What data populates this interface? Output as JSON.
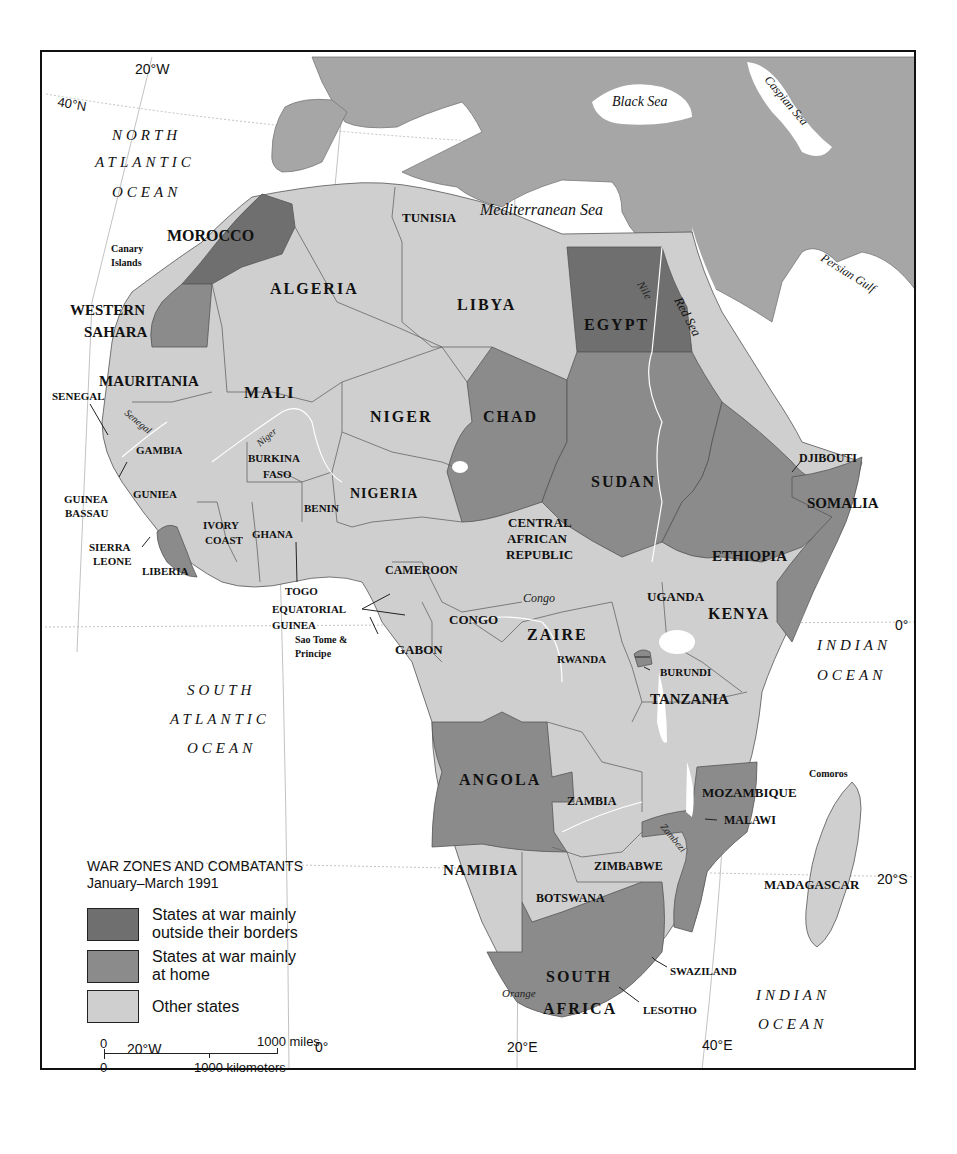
{
  "colors": {
    "war_outside": "#6f6f6f",
    "war_home": "#8b8b8b",
    "other": "#cfcfcf",
    "non_africa_land": "#a6a6a6",
    "water": "#ffffff",
    "border": "#555555"
  },
  "legend": {
    "title": "WAR ZONES AND COMBATANTS",
    "subtitle": "January–March 1991",
    "items": [
      {
        "label_line1": "States at war mainly",
        "label_line2": "outside their borders",
        "category": "war_outside"
      },
      {
        "label_line1": "States at war mainly",
        "label_line2": "at home",
        "category": "war_home"
      },
      {
        "label_line1": "Other states",
        "label_line2": "",
        "category": "other"
      }
    ]
  },
  "scale": {
    "miles_zero": "0",
    "miles_label": "1000 miles",
    "km_zero": "0",
    "km_label": "1000 kilometers"
  },
  "coordinates": {
    "top_20w": "20°W",
    "lat_40n": "40°N",
    "equator": "0°",
    "lat_20s": "20°S",
    "bottom_20w": "20°W",
    "bottom_0": "0°",
    "bottom_20e": "20°E",
    "bottom_40e": "40°E"
  },
  "water_labels": {
    "north_atlantic": [
      "NORTH",
      "ATLANTIC",
      "OCEAN"
    ],
    "south_atlantic": [
      "SOUTH",
      "ATLANTIC",
      "OCEAN"
    ],
    "indian_east": [
      "INDIAN",
      "OCEAN"
    ],
    "indian_south": [
      "INDIAN",
      "OCEAN"
    ],
    "black_sea": "Black Sea",
    "caspian_sea": "Caspian Sea",
    "mediterranean": "Mediterranean Sea",
    "persian_gulf": "Persian Gulf",
    "red_sea": "Red Sea"
  },
  "rivers": {
    "nile": "Nile",
    "senegal": "Senegal",
    "niger": "Niger",
    "congo": "Congo",
    "zambezi": "Zambezi",
    "orange": "Orange"
  },
  "countries": [
    {
      "name": "MOROCCO",
      "category": "war_outside"
    },
    {
      "name": "WESTERN SAHARA",
      "category": "war_home"
    },
    {
      "name": "ALGERIA",
      "category": "other"
    },
    {
      "name": "TUNISIA",
      "category": "other"
    },
    {
      "name": "LIBYA",
      "category": "other"
    },
    {
      "name": "EGYPT",
      "category": "war_outside"
    },
    {
      "name": "MAURITANIA",
      "category": "other"
    },
    {
      "name": "MALI",
      "category": "other"
    },
    {
      "name": "NIGER",
      "category": "other"
    },
    {
      "name": "CHAD",
      "category": "war_home"
    },
    {
      "name": "SUDAN",
      "category": "war_home"
    },
    {
      "name": "SENEGAL",
      "category": "other"
    },
    {
      "name": "GAMBIA",
      "category": "other"
    },
    {
      "name": "GUINEA BASSAU",
      "category": "other"
    },
    {
      "name": "GUNIEA",
      "category": "other"
    },
    {
      "name": "SIERRA LEONE",
      "category": "other"
    },
    {
      "name": "LIBERIA",
      "category": "war_home"
    },
    {
      "name": "IVORY COAST",
      "category": "other"
    },
    {
      "name": "BURKINA FASO",
      "category": "other"
    },
    {
      "name": "GHANA",
      "category": "other"
    },
    {
      "name": "TOGO",
      "category": "other"
    },
    {
      "name": "BENIN",
      "category": "other"
    },
    {
      "name": "NIGERIA",
      "category": "other"
    },
    {
      "name": "CAMEROON",
      "category": "other"
    },
    {
      "name": "EQUATORIAL GUINEA",
      "category": "other"
    },
    {
      "name": "Sao Tome & Principe",
      "category": "other"
    },
    {
      "name": "GABON",
      "category": "other"
    },
    {
      "name": "CONGO",
      "category": "other"
    },
    {
      "name": "CENTRAL AFRICAN REPUBLIC",
      "category": "other"
    },
    {
      "name": "ZAIRE",
      "category": "other"
    },
    {
      "name": "ETHIOPIA",
      "category": "war_home"
    },
    {
      "name": "DJIBOUTI",
      "category": "other"
    },
    {
      "name": "SOMALIA",
      "category": "war_home"
    },
    {
      "name": "UGANDA",
      "category": "other"
    },
    {
      "name": "KENYA",
      "category": "other"
    },
    {
      "name": "RWANDA",
      "category": "war_home"
    },
    {
      "name": "BURUNDI",
      "category": "other"
    },
    {
      "name": "TANZANIA",
      "category": "other"
    },
    {
      "name": "ANGOLA",
      "category": "war_home"
    },
    {
      "name": "ZAMBIA",
      "category": "other"
    },
    {
      "name": "MALAWI",
      "category": "other"
    },
    {
      "name": "MOZAMBIQUE",
      "category": "war_home"
    },
    {
      "name": "Comoros",
      "category": "other"
    },
    {
      "name": "MADAGASCAR",
      "category": "other"
    },
    {
      "name": "NAMIBIA",
      "category": "other"
    },
    {
      "name": "ZIMBABWE",
      "category": "other"
    },
    {
      "name": "BOTSWANA",
      "category": "other"
    },
    {
      "name": "SOUTH AFRICA",
      "category": "war_home"
    },
    {
      "name": "SWAZILAND",
      "category": "other"
    },
    {
      "name": "LESOTHO",
      "category": "other"
    }
  ],
  "labels": {
    "morocco": "MOROCCO",
    "canary": [
      "Canary",
      "Islands"
    ],
    "western_sahara": [
      "WESTERN",
      "SAHARA"
    ],
    "algeria": "ALGERIA",
    "tunisia": "TUNISIA",
    "libya": "LIBYA",
    "egypt": "EGYPT",
    "mauritania": "MAURITANIA",
    "mali": "MALI",
    "niger": "NIGER",
    "chad": "CHAD",
    "sudan": "SUDAN",
    "senegal": "SENEGAL",
    "gambia": "GAMBIA",
    "guinea_bassau": [
      "GUINEA",
      "BASSAU"
    ],
    "guniea": "GUNIEA",
    "sierra_leone": [
      "SIERRA",
      "LEONE"
    ],
    "liberia": "LIBERIA",
    "ivory_coast": [
      "IVORY",
      "COAST"
    ],
    "burkina_faso": [
      "BURKINA",
      "FASO"
    ],
    "ghana": "GHANA",
    "togo": "TOGO",
    "benin": "BENIN",
    "nigeria": "NIGERIA",
    "cameroon": "CAMEROON",
    "equatorial_guinea": [
      "EQUATORIAL",
      "GUINEA"
    ],
    "sao_tome": [
      "Sao Tome &",
      "Principe"
    ],
    "gabon": "GABON",
    "congo": "CONGO",
    "car": [
      "CENTRAL",
      "AFRICAN",
      "REPUBLIC"
    ],
    "zaire": "ZAIRE",
    "ethiopia": "ETHIOPIA",
    "djibouti": "DJIBOUTI",
    "somalia": "SOMALIA",
    "uganda": "UGANDA",
    "kenya": "KENYA",
    "rwanda": "RWANDA",
    "burundi": "BURUNDI",
    "tanzania": "TANZANIA",
    "angola": "ANGOLA",
    "zambia": "ZAMBIA",
    "malawi": "MALAWI",
    "mozambique": "MOZAMBIQUE",
    "comoros": "Comoros",
    "madagascar": "MADAGASCAR",
    "namibia": "NAMIBIA",
    "zimbabwe": "ZIMBABWE",
    "botswana": "BOTSWANA",
    "south_africa": [
      "SOUTH",
      "AFRICA"
    ],
    "swaziland": "SWAZILAND",
    "lesotho": "LESOTHO"
  }
}
